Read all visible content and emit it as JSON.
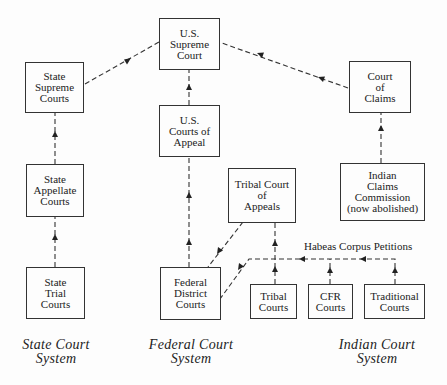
{
  "diagram": {
    "boxes": {
      "us_supreme_court": "U.S.\nSupreme\nCourt",
      "state_supreme_courts": "State\nSupreme\nCourts",
      "us_courts_of_appeal": "U.S.\nCourts of\nAppeal",
      "state_appellate_courts": "State\nAppellate\nCourts",
      "court_of_claims": "Court\nof\nClaims",
      "indian_claims_commission": "Indian\nClaims\nCommission\n(now abolished)",
      "tribal_court_of_appeals": "Tribal Court\nof\nAppeals",
      "state_trial_courts": "State\nTrial\nCourts",
      "federal_district_courts": "Federal\nDistrict\nCourts",
      "tribal_courts": "Tribal\nCourts",
      "cfr_courts": "CFR\nCourts",
      "traditional_courts": "Traditional\nCourts"
    },
    "edge_label": "Habeas Corpus Petitions",
    "systems": {
      "state": "State Court\nSystem",
      "federal": "Federal Court\nSystem",
      "indian": "Indian Court\nSystem"
    },
    "edges": [
      {
        "from": "state_trial_courts",
        "to": "state_appellate_courts"
      },
      {
        "from": "state_appellate_courts",
        "to": "state_supreme_courts"
      },
      {
        "from": "state_supreme_courts",
        "to": "us_supreme_court"
      },
      {
        "from": "federal_district_courts",
        "to": "us_courts_of_appeal"
      },
      {
        "from": "us_courts_of_appeal",
        "to": "us_supreme_court"
      },
      {
        "from": "court_of_claims",
        "to": "us_supreme_court"
      },
      {
        "from": "indian_claims_commission",
        "to": "court_of_claims"
      },
      {
        "from": "tribal_court_of_appeals",
        "to": "federal_district_courts"
      },
      {
        "from": "tribal_courts",
        "to": "tribal_court_of_appeals"
      },
      {
        "from": "tribal_courts",
        "to": "federal_district_courts",
        "label": "Habeas Corpus Petitions"
      },
      {
        "from": "cfr_courts",
        "to": "federal_district_courts",
        "label": "Habeas Corpus Petitions"
      },
      {
        "from": "traditional_courts",
        "to": "federal_district_courts",
        "label": "Habeas Corpus Petitions"
      }
    ]
  }
}
